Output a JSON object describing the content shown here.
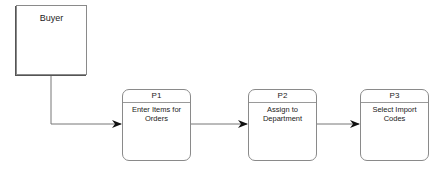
{
  "entity": {
    "label": "Buyer"
  },
  "processes": [
    {
      "id": "P1",
      "name": "Enter Items for Orders"
    },
    {
      "id": "P2",
      "name": "Assign to Department"
    },
    {
      "id": "P3",
      "name": "Select Import Codes"
    }
  ],
  "colors": {
    "border": "#8a8a8a",
    "line": "#777777",
    "arrow": "#111111",
    "text": "#222222"
  }
}
